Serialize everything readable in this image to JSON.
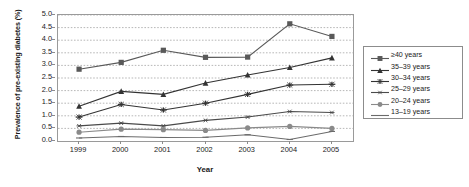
{
  "chart_data": {
    "type": "line",
    "title": "",
    "xlabel": "Year",
    "ylabel": "Prevalence of pre-existing diabetes (%)",
    "categories": [
      "1999",
      "2000",
      "2001",
      "2002",
      "2003",
      "2004",
      "2005"
    ],
    "x": [
      1999,
      2000,
      2001,
      2002,
      2003,
      2004,
      2005
    ],
    "xlim": [
      1998.5,
      2005.5
    ],
    "ylim": [
      0.0,
      5.0
    ],
    "yticks": [
      "0.0",
      "0.5",
      "1.0",
      "1.5",
      "2.0",
      "2.5",
      "3.0",
      "3.5",
      "4.0",
      "4.5",
      "5.0"
    ],
    "ytick_values": [
      0.0,
      0.5,
      1.0,
      1.5,
      2.0,
      2.5,
      3.0,
      3.5,
      4.0,
      4.5,
      5.0
    ],
    "grid": "horizontal-dotted",
    "legend_position": "right",
    "series": [
      {
        "name": "≥40 years",
        "marker": "square",
        "color": "#595959",
        "values": [
          2.85,
          3.12,
          3.6,
          3.32,
          3.33,
          4.65,
          4.15
        ]
      },
      {
        "name": "35–39 years",
        "marker": "triangle",
        "color": "#333333",
        "values": [
          1.38,
          1.97,
          1.85,
          2.3,
          2.62,
          2.92,
          3.3
        ]
      },
      {
        "name": "30–34 years",
        "marker": "cross",
        "color": "#333333",
        "values": [
          0.95,
          1.45,
          1.23,
          1.5,
          1.85,
          2.22,
          2.25
        ]
      },
      {
        "name": "25–29 years",
        "marker": "asterisk",
        "color": "#4a4a4a",
        "values": [
          0.6,
          0.71,
          0.6,
          0.82,
          0.95,
          1.17,
          1.13
        ]
      },
      {
        "name": "20–24 years",
        "marker": "circle",
        "color": "#8a8a8a",
        "values": [
          0.35,
          0.47,
          0.45,
          0.42,
          0.52,
          0.58,
          0.5
        ]
      },
      {
        "name": "13–19 years",
        "marker": "line",
        "color": "#6b6b6b",
        "values": [
          0.12,
          0.18,
          0.14,
          0.15,
          0.25,
          0.06,
          0.38
        ]
      }
    ]
  },
  "legend": {
    "items": [
      {
        "label": "≥40 years"
      },
      {
        "label": "35–39 years"
      },
      {
        "label": "30–34 years"
      },
      {
        "label": "25–29 years"
      },
      {
        "label": "20–24 years"
      },
      {
        "label": "13–19 years"
      }
    ]
  }
}
